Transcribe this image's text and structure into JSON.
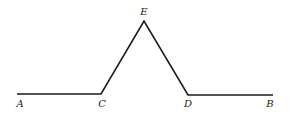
{
  "diagram": {
    "type": "geometry",
    "stroke_color": "#1a1a1a",
    "points": [
      {
        "id": "A",
        "label": "A",
        "x": 17,
        "y": 94,
        "lx": 20,
        "ly": 107
      },
      {
        "id": "C",
        "label": "C",
        "x": 101,
        "y": 94,
        "lx": 102,
        "ly": 107
      },
      {
        "id": "E",
        "label": "E",
        "x": 144,
        "y": 21,
        "lx": 144,
        "ly": 15
      },
      {
        "id": "D",
        "label": "D",
        "x": 188,
        "y": 95,
        "lx": 188,
        "ly": 107
      },
      {
        "id": "B",
        "label": "B",
        "x": 273,
        "y": 95,
        "lx": 270,
        "ly": 107
      }
    ],
    "segments": [
      [
        "A",
        "C"
      ],
      [
        "C",
        "E"
      ],
      [
        "E",
        "D"
      ],
      [
        "D",
        "B"
      ]
    ]
  }
}
